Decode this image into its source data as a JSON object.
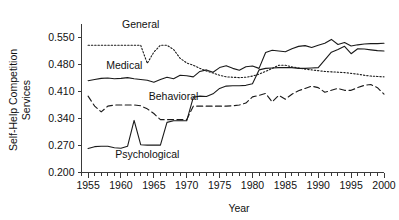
{
  "chart_data": {
    "type": "line",
    "title": "",
    "xlabel": "Year",
    "ylabel": "Self-Help Competition Services",
    "ylabel_line1": "Self-Help Competition",
    "ylabel_line2": "Services",
    "xlim": [
      1954,
      2000
    ],
    "ylim": [
      0.2,
      0.585
    ],
    "grid": false,
    "legend": "inline-labels",
    "xticks_major": [
      1955,
      1960,
      1965,
      1970,
      1975,
      1980,
      1985,
      1990,
      1995,
      2000
    ],
    "xtick_labels": [
      "1955",
      "1960",
      "1965",
      "1970",
      "1975",
      "1980",
      "1985",
      "1990",
      "1995",
      "2000"
    ],
    "xticks_minor_step": 1,
    "yticks": [
      0.2,
      0.27,
      0.34,
      0.41,
      0.48,
      0.55
    ],
    "ytick_labels": [
      "0.200",
      "0.270",
      "0.340",
      "0.410",
      "0.480",
      "0.550"
    ],
    "x": [
      1955,
      1956,
      1957,
      1958,
      1959,
      1960,
      1961,
      1962,
      1963,
      1964,
      1965,
      1966,
      1967,
      1968,
      1969,
      1970,
      1971,
      1972,
      1973,
      1974,
      1975,
      1976,
      1977,
      1978,
      1979,
      1980,
      1981,
      1982,
      1983,
      1984,
      1985,
      1986,
      1987,
      1988,
      1989,
      1990,
      1991,
      1992,
      1993,
      1994,
      1995,
      1996,
      1997,
      1998,
      1999,
      2000
    ],
    "series": [
      {
        "name": "General",
        "label": "General",
        "style": "dotted",
        "label_x": 1963.0,
        "label_y": 0.575,
        "values": [
          0.53,
          0.53,
          0.53,
          0.53,
          0.53,
          0.53,
          0.53,
          0.53,
          0.53,
          0.483,
          0.512,
          0.53,
          0.53,
          0.519,
          0.496,
          0.484,
          0.478,
          0.47,
          0.463,
          0.458,
          0.452,
          0.448,
          0.447,
          0.446,
          0.447,
          0.45,
          0.455,
          0.462,
          0.47,
          0.478,
          0.478,
          0.474,
          0.471,
          0.468,
          0.466,
          0.464,
          0.462,
          0.461,
          0.46,
          0.459,
          0.457,
          0.455,
          0.452,
          0.45,
          0.449,
          0.448
        ]
      },
      {
        "name": "Medical",
        "label": "Medical",
        "style": "solid",
        "label_x": 1960.5,
        "label_y": 0.468,
        "values": [
          0.438,
          0.441,
          0.444,
          0.445,
          0.443,
          0.444,
          0.446,
          0.443,
          0.441,
          0.439,
          0.434,
          0.441,
          0.447,
          0.443,
          0.452,
          0.451,
          0.448,
          0.462,
          0.466,
          0.46,
          0.472,
          0.477,
          0.47,
          0.465,
          0.474,
          0.476,
          0.47,
          0.511,
          0.517,
          0.515,
          0.513,
          0.521,
          0.527,
          0.529,
          0.524,
          0.53,
          0.535,
          0.545,
          0.532,
          0.537,
          0.528,
          0.531,
          0.533,
          0.534,
          0.534,
          0.535
        ]
      },
      {
        "name": "Behavioral",
        "label": "Behavioral",
        "style": "dashed",
        "label_x": 1968.0,
        "label_y": 0.387,
        "values": [
          0.398,
          0.372,
          0.357,
          0.372,
          0.375,
          0.375,
          0.375,
          0.375,
          0.373,
          0.365,
          0.353,
          0.337,
          0.337,
          0.337,
          0.337,
          0.337,
          0.372,
          0.372,
          0.372,
          0.372,
          0.372,
          0.372,
          0.373,
          0.375,
          0.38,
          0.396,
          0.4,
          0.405,
          0.383,
          0.4,
          0.39,
          0.403,
          0.412,
          0.418,
          0.424,
          0.42,
          0.408,
          0.413,
          0.418,
          0.413,
          0.413,
          0.42,
          0.426,
          0.428,
          0.42,
          0.403
        ]
      },
      {
        "name": "Psychological",
        "label": "Psychological",
        "style": "solid",
        "label_x": 1964.0,
        "label_y": 0.238,
        "values": [
          0.262,
          0.267,
          0.268,
          0.268,
          0.264,
          0.263,
          0.268,
          0.335,
          0.272,
          0.271,
          0.271,
          0.271,
          0.33,
          0.334,
          0.334,
          0.334,
          0.395,
          0.398,
          0.397,
          0.404,
          0.418,
          0.424,
          0.425,
          0.425,
          0.426,
          0.43,
          0.466,
          0.47,
          0.471,
          0.472,
          0.472,
          0.472,
          0.47,
          0.47,
          0.471,
          0.472,
          0.492,
          0.512,
          0.519,
          0.527,
          0.508,
          0.521,
          0.52,
          0.518,
          0.516,
          0.515
        ]
      }
    ]
  }
}
